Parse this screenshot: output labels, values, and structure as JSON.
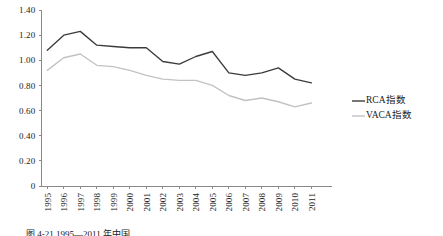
{
  "chart_data": {
    "type": "line",
    "title": "",
    "xlabel": "",
    "ylabel": "",
    "ylim": [
      0,
      1.4
    ],
    "grid": false,
    "legend_position": "right",
    "categories": [
      "1995",
      "1996",
      "1997",
      "1998",
      "1999",
      "2000",
      "2001",
      "2002",
      "2003",
      "2004",
      "2005",
      "2006",
      "2007",
      "2008",
      "2009",
      "2010",
      "2011"
    ],
    "ytick_labels": [
      "1.40",
      "1.20",
      "1.00",
      "0.80",
      "0.60",
      "0.40",
      "0.20",
      "0"
    ],
    "ytick_values": [
      1.4,
      1.2,
      1.0,
      0.8,
      0.6,
      0.4,
      0.2,
      0
    ],
    "series": [
      {
        "name": "RCA指数",
        "color": "#3b3b3b",
        "values": [
          1.08,
          1.2,
          1.23,
          1.12,
          1.11,
          1.1,
          1.1,
          0.99,
          0.97,
          1.03,
          1.07,
          0.9,
          0.88,
          0.9,
          0.94,
          0.85,
          0.82
        ]
      },
      {
        "name": "VACA指数",
        "color": "#c2c2c2",
        "values": [
          0.92,
          1.02,
          1.05,
          0.96,
          0.95,
          0.92,
          0.88,
          0.85,
          0.84,
          0.84,
          0.8,
          0.72,
          0.68,
          0.7,
          0.67,
          0.63,
          0.66
        ]
      }
    ]
  },
  "legend": {
    "items": [
      {
        "label": "RCA指数",
        "color": "#3b3b3b"
      },
      {
        "label": "VACA指数",
        "color": "#c2c2c2"
      }
    ]
  },
  "caption": {
    "text": "图 4-21  1995—2011 年中国"
  },
  "colors": {
    "axis": "#8a8a8a",
    "text": "#1a1a1a",
    "background": "#ffffff"
  }
}
